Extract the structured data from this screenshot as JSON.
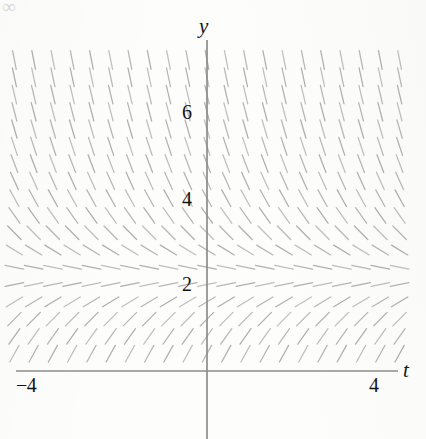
{
  "figure": {
    "title": "",
    "corner_artifact": "∞"
  },
  "axes": {
    "x_axis_label": "t",
    "y_axis_label": "y",
    "x_ticks": [
      {
        "value": -4,
        "label": "−4"
      },
      {
        "value": 4,
        "label": "4"
      }
    ],
    "y_ticks": [
      {
        "value": 2,
        "label": "2"
      },
      {
        "value": 4,
        "label": "4"
      },
      {
        "value": 6,
        "label": "6"
      }
    ]
  },
  "chart_data": {
    "type": "scatter",
    "subtype": "direction-field",
    "title": "",
    "xlabel": "t",
    "ylabel": "y",
    "xlim": [
      -5,
      5
    ],
    "ylim": [
      -1,
      8
    ],
    "grid": false,
    "legend": null,
    "x_tick_labels": [
      "−4",
      "4"
    ],
    "x_tick_values": [
      -4,
      4
    ],
    "y_tick_labels": [
      "2",
      "4",
      "6"
    ],
    "y_tick_values": [
      2,
      4,
      6
    ],
    "slope_formula": "dy/dt = 2.2 - y",
    "equilibrium_y": 2.2,
    "grid_columns": 21,
    "grid_rows": 19,
    "grid_t_values": [
      -4.5,
      -4.05,
      -3.6,
      -3.15,
      -2.7,
      -2.25,
      -1.8,
      -1.35,
      -0.9,
      -0.45,
      0,
      0.45,
      0.9,
      1.35,
      1.8,
      2.25,
      2.7,
      3.15,
      3.6,
      4.05,
      4.5
    ],
    "grid_y_values": [
      7.6,
      7.2,
      6.8,
      6.4,
      6.0,
      5.6,
      5.2,
      4.8,
      4.4,
      4.0,
      3.6,
      3.2,
      2.8,
      2.4,
      2.0,
      1.6,
      1.2,
      0.8,
      0.4
    ],
    "row_slopes": [
      -5.4,
      -5.0,
      -4.6,
      -4.2,
      -3.8,
      -3.4,
      -3.0,
      -2.6,
      -2.2,
      -1.8,
      -1.4,
      -1.0,
      -0.6,
      -0.2,
      0.2,
      0.6,
      1.0,
      1.4,
      1.8
    ],
    "series": [
      {
        "name": "slope marks",
        "description": "short line segments whose inclination equals 2.2 − y"
      }
    ],
    "annotations": [],
    "colors": {
      "axis": "#8c8c8c",
      "slope_mark": "#9a9a9a",
      "text": "#141414",
      "background": "#fdfdfc"
    }
  },
  "geometry": {
    "origin_px": {
      "x": 207,
      "y": 371
    },
    "px_per_unit_x": 42.8,
    "px_per_unit_y": 43.2,
    "mark_half_length_px": 9.5
  }
}
